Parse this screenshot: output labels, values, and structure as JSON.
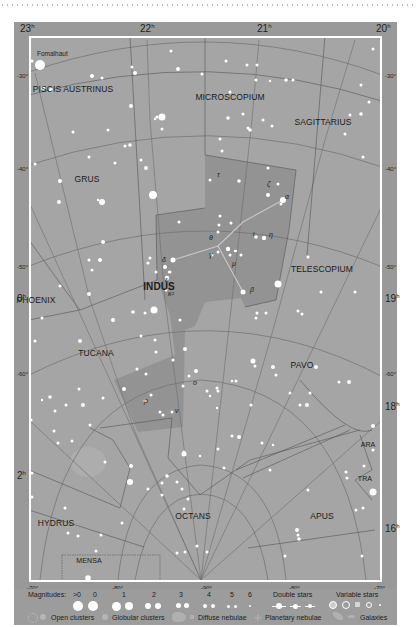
{
  "map": {
    "title": "Indus star chart",
    "highlight_constellation": "INDUS",
    "colors": {
      "frame": "#999999",
      "sky": "#a5a5a5",
      "highlight": "#8f8f8f",
      "border": "#ffffff",
      "grid": "#6e6e6e",
      "star": "#ffffff",
      "text": "#1e1e1e"
    },
    "ra_top": [
      {
        "label": "23",
        "unit": "h",
        "x": 20
      },
      {
        "label": "22",
        "unit": "h",
        "x": 140
      },
      {
        "label": "21",
        "unit": "h",
        "x": 257
      },
      {
        "label": "20",
        "unit": "h",
        "x": 376
      }
    ],
    "ra_side": [
      {
        "label": "0",
        "unit": "h",
        "x": 17,
        "y": 293
      },
      {
        "label": "2",
        "unit": "h",
        "x": 17,
        "y": 470
      },
      {
        "label": "19",
        "unit": "h",
        "x": 385,
        "y": 293
      },
      {
        "label": "18",
        "unit": "h",
        "x": 385,
        "y": 401
      },
      {
        "label": "16",
        "unit": "h",
        "x": 385,
        "y": 523
      }
    ],
    "dec_left": [
      {
        "label": "-30°",
        "y": 73
      },
      {
        "label": "-40°",
        "y": 166
      },
      {
        "label": "-50°",
        "y": 264
      },
      {
        "label": "-60°",
        "y": 371
      }
    ],
    "dec_right": [
      {
        "label": "-30°",
        "y": 73
      },
      {
        "label": "-40°",
        "y": 166
      },
      {
        "label": "-50°",
        "y": 264
      },
      {
        "label": "-60°",
        "y": 371
      }
    ],
    "dec_bottom": [
      {
        "label": "-70°",
        "x": 27
      },
      {
        "label": "-80°",
        "x": 112
      },
      {
        "label": "-90°",
        "x": 201
      },
      {
        "label": "-80°",
        "x": 289
      },
      {
        "label": "-70°",
        "x": 374
      }
    ],
    "constellations": [
      {
        "name": "PISCIS AUSTRINUS",
        "x": 73,
        "y": 89,
        "style": ""
      },
      {
        "name": "MICROSCOPIUM",
        "x": 230,
        "y": 97,
        "style": ""
      },
      {
        "name": "SAGITTARIUS",
        "x": 323,
        "y": 122,
        "style": ""
      },
      {
        "name": "GRUS",
        "x": 87,
        "y": 179,
        "style": ""
      },
      {
        "name": "INDUS",
        "x": 159,
        "y": 286,
        "style": "bold"
      },
      {
        "name": "TELESCOPIUM",
        "x": 322,
        "y": 269,
        "style": ""
      },
      {
        "name": "PHOENIX",
        "x": 36,
        "y": 300,
        "style": ""
      },
      {
        "name": "TUCANA",
        "x": 96,
        "y": 353,
        "style": ""
      },
      {
        "name": "PAVO",
        "x": 302,
        "y": 365,
        "style": ""
      },
      {
        "name": "ARA",
        "x": 368,
        "y": 446,
        "style": "small"
      },
      {
        "name": "TRA",
        "x": 365,
        "y": 480,
        "style": "small"
      },
      {
        "name": "HYDRUS",
        "x": 56,
        "y": 523,
        "style": ""
      },
      {
        "name": "OCTANS",
        "x": 193,
        "y": 516,
        "style": ""
      },
      {
        "name": "APUS",
        "x": 322,
        "y": 516,
        "style": ""
      },
      {
        "name": "MENSA",
        "x": 89,
        "y": 562,
        "style": "small"
      }
    ],
    "named_stars": [
      {
        "name": "Fomalhaut",
        "x": 37,
        "y": 55
      }
    ],
    "greek_labels": [
      {
        "label": "α",
        "x": 285,
        "y": 197
      },
      {
        "label": "β",
        "x": 250,
        "y": 290
      },
      {
        "label": "γ",
        "x": 209,
        "y": 255
      },
      {
        "label": "δ",
        "x": 162,
        "y": 260
      },
      {
        "label": "ε",
        "x": 165,
        "y": 280
      },
      {
        "label": "ζ",
        "x": 267,
        "y": 184
      },
      {
        "label": "η",
        "x": 269,
        "y": 235
      },
      {
        "label": "θ",
        "x": 209,
        "y": 238
      },
      {
        "label": "ι",
        "x": 253,
        "y": 234
      },
      {
        "label": "κ²",
        "x": 168,
        "y": 294
      },
      {
        "label": "μ",
        "x": 232,
        "y": 264
      },
      {
        "label": "τ",
        "x": 217,
        "y": 175
      },
      {
        "label": "ρ",
        "x": 144,
        "y": 401
      },
      {
        "label": "ν",
        "x": 175,
        "y": 411
      },
      {
        "label": "ο",
        "x": 193,
        "y": 383
      }
    ]
  },
  "stars": [
    [
      40,
      65,
      5
    ],
    [
      32,
      61,
      1.5
    ],
    [
      102,
      78,
      1.5
    ],
    [
      171,
      51,
      1.5
    ],
    [
      178,
      69,
      2
    ],
    [
      132,
      67,
      1.5
    ],
    [
      135,
      73,
      2
    ],
    [
      92,
      76,
      2
    ],
    [
      226,
      61,
      1.5
    ],
    [
      247,
      65,
      1.5
    ],
    [
      257,
      65,
      1.5
    ],
    [
      383,
      51,
      1.5
    ],
    [
      384,
      47,
      1.5
    ],
    [
      389,
      42,
      1.5
    ],
    [
      373,
      49,
      1.5
    ],
    [
      286,
      80,
      1.8
    ],
    [
      293,
      80,
      1.5
    ],
    [
      256,
      80,
      1.5
    ],
    [
      270,
      81,
      1.2
    ],
    [
      361,
      85,
      1.5
    ],
    [
      369,
      102,
      1.5
    ],
    [
      361,
      114,
      1.8
    ],
    [
      350,
      115,
      1.5
    ],
    [
      345,
      134,
      1.5
    ],
    [
      363,
      157,
      1.5
    ],
    [
      43,
      88,
      2
    ],
    [
      51,
      90,
      2
    ],
    [
      28,
      111,
      1.5
    ],
    [
      131,
      106,
      2
    ],
    [
      162,
      117,
      3.5
    ],
    [
      157,
      117,
      1.5
    ],
    [
      155,
      119,
      1.2
    ],
    [
      162,
      129,
      1.5
    ],
    [
      108,
      130,
      1.5
    ],
    [
      73,
      132,
      1.5
    ],
    [
      125,
      146,
      1.5
    ],
    [
      130,
      145,
      1.8
    ],
    [
      89,
      157,
      1.5
    ],
    [
      115,
      163,
      1.5
    ],
    [
      146,
      168,
      2
    ],
    [
      141,
      160,
      1.5
    ],
    [
      202,
      74,
      1.5
    ],
    [
      230,
      92,
      1.5
    ],
    [
      228,
      118,
      1.8
    ],
    [
      243,
      114,
      1.5
    ],
    [
      263,
      120,
      1.5
    ],
    [
      248,
      128,
      1.5
    ],
    [
      220,
      139,
      1.5
    ],
    [
      272,
      126,
      1.5
    ],
    [
      250,
      130,
      1.8
    ],
    [
      35,
      164,
      1.5
    ],
    [
      60,
      181,
      2
    ],
    [
      59,
      202,
      2
    ],
    [
      153,
      195,
      4
    ],
    [
      102,
      202,
      3
    ],
    [
      98,
      200,
      1.2
    ],
    [
      103,
      242,
      2
    ],
    [
      89,
      260,
      1.5
    ],
    [
      165,
      267,
      2
    ],
    [
      150,
      258,
      1.5
    ],
    [
      222,
      151,
      1.5
    ],
    [
      268,
      168,
      1.5
    ],
    [
      278,
      184,
      1.5
    ],
    [
      268,
      195,
      2
    ],
    [
      281,
      204,
      1.5
    ],
    [
      210,
      180,
      1.5
    ],
    [
      239,
      181,
      1.8
    ],
    [
      179,
      222,
      1.5
    ],
    [
      231,
      223,
      1.5
    ],
    [
      283,
      200,
      3
    ],
    [
      220,
      216,
      1.5
    ],
    [
      219,
      225,
      1.5
    ],
    [
      218,
      232,
      1.5
    ],
    [
      256,
      237,
      1.8
    ],
    [
      264,
      238,
      2.2
    ],
    [
      228,
      249,
      2.2
    ],
    [
      218,
      252,
      1.5
    ],
    [
      235,
      251,
      1.2
    ],
    [
      230,
      255,
      1.5
    ],
    [
      212,
      255,
      1.5
    ],
    [
      173,
      260,
      2.5
    ],
    [
      170,
      272,
      1.5
    ],
    [
      167,
      278,
      2.2
    ],
    [
      148,
      263,
      1.5
    ],
    [
      156,
      272,
      1.5
    ],
    [
      166,
      290,
      1.5
    ],
    [
      154,
      310,
      3.5
    ],
    [
      100,
      260,
      2
    ],
    [
      92,
      270,
      1.5
    ],
    [
      113,
      320,
      2
    ],
    [
      133,
      312,
      1.8
    ],
    [
      145,
      313,
      1.5
    ],
    [
      241,
      255,
      1.5
    ],
    [
      243,
      292,
      2.5
    ],
    [
      278,
      284,
      3.5
    ],
    [
      308,
      257,
      1.5
    ],
    [
      321,
      292,
      1.5
    ],
    [
      355,
      292,
      1.5
    ],
    [
      257,
      313,
      1.5
    ],
    [
      266,
      313,
      1.5
    ],
    [
      256,
      318,
      1.5
    ],
    [
      298,
      311,
      1.5
    ],
    [
      302,
      314,
      1.5
    ],
    [
      236,
      251,
      1.2
    ],
    [
      141,
      336,
      1.5
    ],
    [
      180,
      320,
      1.5
    ],
    [
      169,
      272,
      1.2
    ],
    [
      155,
      340,
      1.5
    ],
    [
      156,
      352,
      1.5
    ],
    [
      185,
      349,
      2
    ],
    [
      89,
      294,
      2
    ],
    [
      60,
      286,
      1.5
    ],
    [
      42,
      318,
      1.5
    ],
    [
      35,
      341,
      1.5
    ],
    [
      80,
      341,
      2
    ],
    [
      146,
      374,
      1.5
    ],
    [
      253,
      361,
      2.5
    ],
    [
      255,
      366,
      1.5
    ],
    [
      273,
      367,
      2
    ],
    [
      276,
      375,
      1.5
    ],
    [
      236,
      381,
      1.5
    ],
    [
      316,
      367,
      2
    ],
    [
      339,
      382,
      1.5
    ],
    [
      349,
      382,
      2
    ],
    [
      310,
      393,
      1.5
    ],
    [
      290,
      393,
      1.5
    ],
    [
      307,
      405,
      2
    ],
    [
      300,
      405,
      1.5
    ],
    [
      251,
      405,
      1.5
    ],
    [
      232,
      381,
      1.2
    ],
    [
      137,
      369,
      1.5
    ],
    [
      173,
      360,
      1.5
    ],
    [
      196,
      371,
      2
    ],
    [
      189,
      376,
      1.5
    ],
    [
      183,
      386,
      1.5
    ],
    [
      217,
      388,
      1.5
    ],
    [
      218,
      391,
      1.5
    ],
    [
      207,
      391,
      1.5
    ],
    [
      210,
      396,
      1.2
    ],
    [
      151,
      395,
      1.5
    ],
    [
      145,
      401,
      1.5
    ],
    [
      124,
      389,
      2
    ],
    [
      172,
      412,
      1.5
    ],
    [
      160,
      412,
      1.5
    ],
    [
      163,
      415,
      1.5
    ],
    [
      217,
      408,
      1.2
    ],
    [
      103,
      398,
      1.5
    ],
    [
      79,
      389,
      1.5
    ],
    [
      50,
      397,
      1.8
    ],
    [
      42,
      400,
      1.2
    ],
    [
      66,
      405,
      1.5
    ],
    [
      83,
      405,
      2
    ],
    [
      55,
      411,
      1.5
    ],
    [
      31,
      420,
      1.5
    ],
    [
      54,
      431,
      1.5
    ],
    [
      90,
      425,
      1.5
    ],
    [
      72,
      441,
      1.5
    ],
    [
      58,
      443,
      1.5
    ],
    [
      105,
      462,
      1.5
    ],
    [
      131,
      466,
      2
    ],
    [
      130,
      482,
      3
    ],
    [
      167,
      476,
      1.8
    ],
    [
      177,
      482,
      1.5
    ],
    [
      182,
      489,
      1.5
    ],
    [
      188,
      499,
      1.5
    ],
    [
      184,
      509,
      1.5
    ],
    [
      162,
      483,
      1.5
    ],
    [
      148,
      489,
      1.5
    ],
    [
      162,
      495,
      1.5
    ],
    [
      200,
      456,
      1.2
    ],
    [
      184,
      454,
      2.5
    ],
    [
      184,
      452,
      1.5
    ],
    [
      218,
      449,
      1.5
    ],
    [
      239,
      437,
      2
    ],
    [
      262,
      443,
      1.5
    ],
    [
      273,
      445,
      1.2
    ],
    [
      232,
      436,
      1.5
    ],
    [
      224,
      468,
      1.5
    ],
    [
      270,
      470,
      1.5
    ],
    [
      308,
      490,
      1.5
    ],
    [
      346,
      472,
      1.5
    ],
    [
      347,
      478,
      1.5
    ],
    [
      364,
      466,
      1.5
    ],
    [
      373,
      450,
      1.5
    ],
    [
      372,
      491,
      1.5
    ],
    [
      373,
      492,
      3.5
    ],
    [
      363,
      508,
      1.5
    ],
    [
      356,
      510,
      1.5
    ],
    [
      373,
      426,
      2
    ],
    [
      297,
      530,
      2
    ],
    [
      298,
      535,
      1.5
    ],
    [
      299,
      539,
      1.8
    ],
    [
      362,
      556,
      1.5
    ],
    [
      285,
      556,
      1.5
    ],
    [
      197,
      546,
      1.5
    ],
    [
      185,
      552,
      1.5
    ],
    [
      177,
      553,
      1.5
    ],
    [
      207,
      552,
      1.5
    ],
    [
      101,
      535,
      1.5
    ],
    [
      78,
      536,
      1.5
    ],
    [
      88,
      578,
      2.8
    ],
    [
      96,
      551,
      1.5
    ],
    [
      32,
      473,
      1.5
    ],
    [
      32,
      497,
      1.5
    ],
    [
      65,
      508,
      1.5
    ],
    [
      68,
      533,
      1.5
    ],
    [
      122,
      523,
      1.5
    ]
  ],
  "legend": {
    "magnitudes_label": "Magnitudes:",
    "magnitudes": [
      ">0",
      "0",
      "1",
      "2",
      "3",
      "4",
      "5",
      "6"
    ],
    "double_stars_label": "Double stars",
    "variable_stars_label": "Variable stars",
    "open_clusters_label": "Open clusters",
    "globular_clusters_label": "Globular clusters",
    "diffuse_nebulae_label": "Diffuse nebulae",
    "planetary_nebulae_label": "Planetary nebulae",
    "galaxies_label": "Galaxies"
  }
}
